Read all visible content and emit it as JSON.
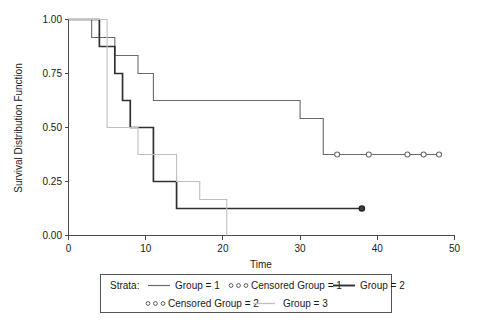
{
  "chart_data": {
    "type": "line",
    "title": "",
    "xlabel": "Time",
    "ylabel": "Survival Distribution Function",
    "xlim": [
      0,
      50
    ],
    "ylim": [
      0.0,
      1.0
    ],
    "xticks": [
      0,
      10,
      20,
      30,
      40,
      50
    ],
    "xtick_labels": [
      "0",
      "10",
      "20",
      "30",
      "40",
      "50"
    ],
    "yticks": [
      0.0,
      0.25,
      0.5,
      0.75,
      1.0
    ],
    "ytick_labels": [
      "0.00",
      "0.25",
      "0.50",
      "0.75",
      "1.00"
    ],
    "grid": false,
    "legend_position": "below",
    "series": [
      {
        "name": "Group = 1",
        "color": "#6b6b6b",
        "style": "step-post",
        "points": [
          [
            0,
            1.0
          ],
          [
            3,
            1.0
          ],
          [
            3,
            0.917
          ],
          [
            6,
            0.917
          ],
          [
            6,
            0.833
          ],
          [
            9,
            0.833
          ],
          [
            9,
            0.75
          ],
          [
            11,
            0.75
          ],
          [
            11,
            0.625
          ],
          [
            30,
            0.625
          ],
          [
            30,
            0.542
          ],
          [
            33,
            0.542
          ],
          [
            33,
            0.375
          ],
          [
            48,
            0.375
          ]
        ],
        "censored_times": [
          34.8,
          38.9,
          43.9,
          46.0,
          48.0
        ],
        "censored_values": [
          0.375,
          0.375,
          0.375,
          0.375,
          0.375
        ]
      },
      {
        "name": "Group = 2",
        "color": "#303030",
        "style": "step-post",
        "points": [
          [
            0,
            1.0
          ],
          [
            4,
            1.0
          ],
          [
            4,
            0.875
          ],
          [
            6,
            0.875
          ],
          [
            6,
            0.75
          ],
          [
            7,
            0.75
          ],
          [
            7,
            0.625
          ],
          [
            8,
            0.625
          ],
          [
            8,
            0.5
          ],
          [
            11,
            0.5
          ],
          [
            11,
            0.25
          ],
          [
            14,
            0.25
          ],
          [
            14,
            0.125
          ],
          [
            38,
            0.125
          ]
        ],
        "censored_times": [
          38.0
        ],
        "censored_values": [
          0.125
        ]
      },
      {
        "name": "Group = 3",
        "color": "#c0c0c0",
        "style": "step-post",
        "points": [
          [
            0,
            1.0
          ],
          [
            5,
            1.0
          ],
          [
            5,
            0.5
          ],
          [
            9,
            0.5
          ],
          [
            9,
            0.375
          ],
          [
            14,
            0.375
          ],
          [
            14,
            0.25
          ],
          [
            17,
            0.25
          ],
          [
            17,
            0.167
          ],
          [
            20.5,
            0.167
          ],
          [
            20.5,
            0.0
          ]
        ],
        "censored_times": [],
        "censored_values": []
      }
    ],
    "legend": {
      "prefix": "Strata:",
      "entries": [
        {
          "label": "Group = 1",
          "marker": "line",
          "color": "#6b6b6b",
          "weight": "thin"
        },
        {
          "label": "Censored Group = 1",
          "marker": "circles",
          "color": "#5a5a5a",
          "weight": "thin"
        },
        {
          "label": "Group = 2",
          "marker": "line",
          "color": "#303030",
          "weight": "thick"
        },
        {
          "label": "Censored Group = 2",
          "marker": "circles",
          "color": "#5a5a5a",
          "weight": "thin"
        },
        {
          "label": "Group = 3",
          "marker": "line",
          "color": "#c0c0c0",
          "weight": "thin"
        }
      ]
    }
  }
}
